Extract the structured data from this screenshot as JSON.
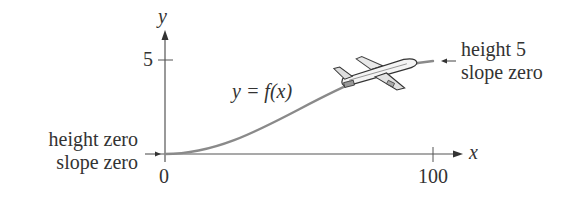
{
  "diagram": {
    "axes": {
      "x_label": "x",
      "y_label": "y",
      "x_ticks": [
        {
          "value": 0,
          "label": "0"
        },
        {
          "value": 100,
          "label": "100"
        }
      ],
      "y_ticks": [
        {
          "value": 5,
          "label": "5"
        }
      ]
    },
    "curve_label": "y = f(x)",
    "start_annotation": {
      "line1": "height zero",
      "line2": "slope zero"
    },
    "end_annotation": {
      "line1": "height 5",
      "line2": "slope zero"
    },
    "icon": "airplane-icon",
    "colors": {
      "curve": "#8a8a8a",
      "axes": "#555555",
      "text": "#333333"
    }
  }
}
